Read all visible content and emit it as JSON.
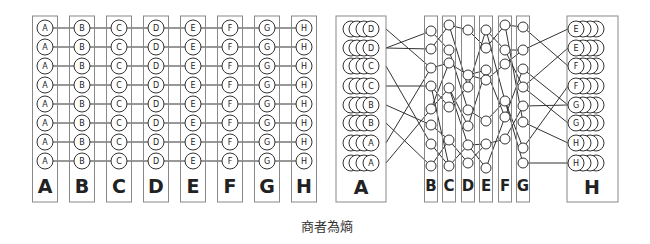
{
  "left_diagram": {
    "columns": [
      "A",
      "B",
      "C",
      "D",
      "E",
      "F",
      "G",
      "H"
    ],
    "rows_per_column": 8,
    "column_labels": [
      "A",
      "B",
      "C",
      "D",
      "E",
      "F",
      "G",
      "H"
    ]
  },
  "right_diagram": {
    "box_A": {
      "label": "A",
      "node_labels": [
        "D",
        "D",
        "C",
        "C",
        "B",
        "B",
        "A",
        "A"
      ]
    },
    "middle_boxes": [
      "B",
      "C",
      "D",
      "E",
      "F",
      "G"
    ],
    "box_H": {
      "label": "H",
      "node_labels": [
        "E",
        "E",
        "F",
        "F",
        "G",
        "G",
        "H",
        "H"
      ]
    }
  },
  "caption": "商者為熵",
  "colors": {
    "stroke": "#333333",
    "box_stroke": "#888888",
    "background": "#ffffff"
  }
}
